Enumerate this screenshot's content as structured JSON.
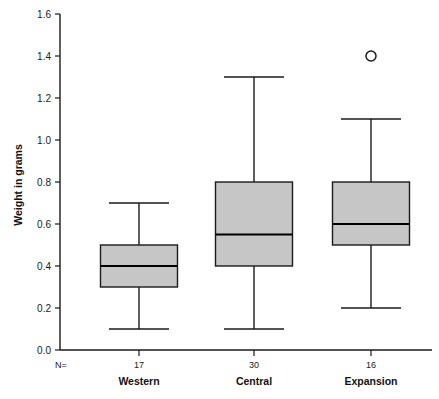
{
  "chart_data": {
    "type": "box",
    "title": "",
    "xlabel": "",
    "ylabel": "Weight in grams",
    "ylim": [
      0.0,
      1.6
    ],
    "yticks": [
      "0.0",
      "0.2",
      "0.4",
      "0.6",
      "0.8",
      "1.0",
      "1.2",
      "1.4",
      "1.6"
    ],
    "ytick_values": [
      0.0,
      0.2,
      0.4,
      0.6,
      0.8,
      1.0,
      1.2,
      1.4,
      1.6
    ],
    "grid": false,
    "legend": "none",
    "n_caption": "N=",
    "categories": [
      "Western",
      "Central",
      "Expansion"
    ],
    "counts": [
      "17",
      "30",
      "16"
    ],
    "boxes": [
      {
        "label": "Western",
        "n": "17",
        "whisker_low": 0.1,
        "q1": 0.3,
        "median": 0.4,
        "q3": 0.5,
        "whisker_high": 0.7,
        "outliers": []
      },
      {
        "label": "Central",
        "n": "30",
        "whisker_low": 0.1,
        "q1": 0.4,
        "median": 0.55,
        "q3": 0.8,
        "whisker_high": 1.3,
        "outliers": []
      },
      {
        "label": "Expansion",
        "n": "16",
        "whisker_low": 0.2,
        "q1": 0.5,
        "median": 0.6,
        "q3": 0.8,
        "whisker_high": 1.1,
        "outliers": [
          1.4
        ]
      }
    ],
    "colors": {
      "box_fill": "#c6c6c6",
      "box_stroke": "#1a1a1a",
      "median": "#000000",
      "axis": "#1a1a1a",
      "background": "#ffffff"
    }
  }
}
